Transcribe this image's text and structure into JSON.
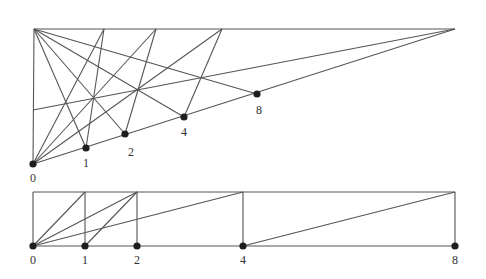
{
  "colors": {
    "line": "#555555",
    "point": "#1e1e1e",
    "label": "#333333",
    "background": "#ffffff"
  },
  "upper_diagram": {
    "apex_left": [
      34,
      29
    ],
    "apex_right": [
      455,
      29
    ],
    "top_points": [
      [
        104,
        29
      ],
      [
        156,
        29
      ],
      [
        222,
        29
      ]
    ],
    "left_wall_point": [
      33,
      110
    ],
    "points": [
      {
        "label": "0",
        "x": 33,
        "y": 164,
        "lx": 33,
        "ly": 181
      },
      {
        "label": "1",
        "x": 86,
        "y": 148,
        "lx": 86,
        "ly": 166
      },
      {
        "label": "2",
        "x": 125,
        "y": 134,
        "lx": 131,
        "ly": 155
      },
      {
        "label": "4",
        "x": 184,
        "y": 117,
        "lx": 184,
        "ly": 135
      },
      {
        "label": "8",
        "x": 257,
        "y": 94,
        "lx": 259,
        "ly": 113
      }
    ]
  },
  "lower_diagram": {
    "top_y": 192,
    "bottom_y": 246,
    "left_x": 33,
    "right_x": 455,
    "points": [
      {
        "label": "0",
        "x": 33
      },
      {
        "label": "1",
        "x": 85
      },
      {
        "label": "2",
        "x": 137
      },
      {
        "label": "4",
        "x": 243
      },
      {
        "label": "8",
        "x": 455
      }
    ]
  }
}
